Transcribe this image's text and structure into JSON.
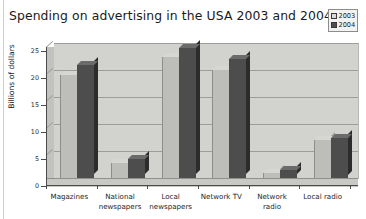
{
  "chart_data": {
    "type": "bar",
    "title": "Spending on advertising in the USA 2003 and 2004",
    "xlabel": "",
    "ylabel": "Billions of dollars",
    "ylim": [
      0,
      25
    ],
    "yticks": [
      0,
      5,
      10,
      15,
      20,
      25
    ],
    "ytick_labels": [
      "0",
      "5",
      "10",
      "15",
      "20",
      "25"
    ],
    "grid": true,
    "legend_position": "top-right",
    "categories": [
      "Magazines",
      "National newspapers",
      "Local newspapers",
      "Network TV",
      "Network radio",
      "Local radio"
    ],
    "category_lines": [
      [
        "Magazines"
      ],
      [
        "National",
        "newspapers"
      ],
      [
        "Local",
        "newspapers"
      ],
      [
        "Network TV"
      ],
      [
        "Network",
        "radio"
      ],
      [
        "Local radio"
      ]
    ],
    "series": [
      {
        "name": "2003",
        "color": "#bdbdba",
        "values": [
          19,
          2.8,
          22.5,
          20,
          0.9,
          7
        ]
      },
      {
        "name": "2004",
        "color": "#4d4d4d",
        "values": [
          21,
          3.5,
          24,
          22,
          1.5,
          7.5
        ]
      }
    ]
  },
  "legend": {
    "items": [
      {
        "label": "2003",
        "color": "#d9d9d6"
      },
      {
        "label": "2004",
        "color": "#4d4d4d"
      }
    ]
  }
}
